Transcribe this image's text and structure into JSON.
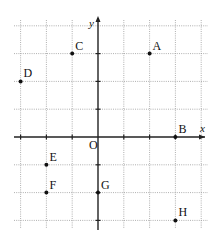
{
  "diagram": {
    "type": "coordinate-plane",
    "axes": {
      "x_label": "x",
      "y_label": "y",
      "origin_label": "O"
    },
    "grid": {
      "x_min": -3,
      "x_max": 4,
      "y_min": -3,
      "y_max": 4,
      "unit": 1,
      "style": "dotted"
    },
    "points": [
      {
        "label": "A",
        "x": 2,
        "y": 3
      },
      {
        "label": "B",
        "x": 3,
        "y": 0
      },
      {
        "label": "C",
        "x": -1,
        "y": 3
      },
      {
        "label": "D",
        "x": -3,
        "y": 2
      },
      {
        "label": "E",
        "x": -2,
        "y": -1
      },
      {
        "label": "F",
        "x": -2,
        "y": -2
      },
      {
        "label": "G",
        "x": 0,
        "y": -2
      },
      {
        "label": "H",
        "x": 3,
        "y": -3
      }
    ]
  },
  "colors": {
    "background": "#ffffff",
    "grid": "#9a9a9a",
    "axis": "#222222",
    "point": "#111111"
  }
}
